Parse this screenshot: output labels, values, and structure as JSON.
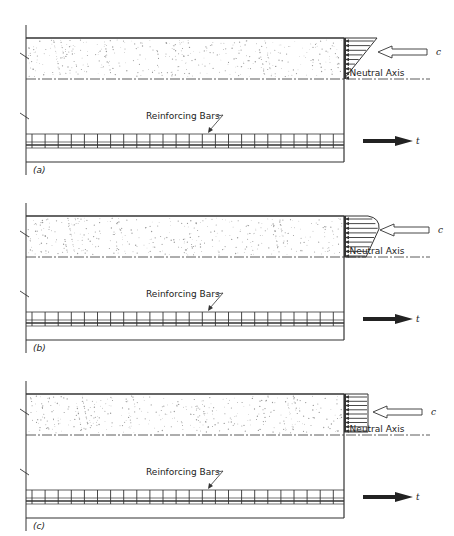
{
  "diagram": {
    "panels": [
      {
        "id": "a",
        "caption": "(a)",
        "stress_shape": "triangular",
        "compression_label": "c",
        "tension_label": "t",
        "neutral_axis_label": "Neutral Axis",
        "rebar_label": "Reinforcing Bars",
        "offset_y": 0
      },
      {
        "id": "b",
        "caption": "(b)",
        "stress_shape": "parabolic",
        "compression_label": "c",
        "tension_label": "t",
        "neutral_axis_label": "Neutral Axis",
        "rebar_label": "Reinforcing Bars",
        "offset_y": 178
      },
      {
        "id": "c",
        "caption": "(c)",
        "stress_shape": "rectangular",
        "compression_label": "c",
        "tension_label": "t",
        "neutral_axis_label": "Neutral Axis",
        "rebar_label": "Reinforcing Bars",
        "offset_y": 356
      }
    ],
    "colors": {
      "line": "#333333",
      "concrete_stipple": "#9a9a9a",
      "tension_arrow": "#222222",
      "background": "#ffffff"
    }
  }
}
